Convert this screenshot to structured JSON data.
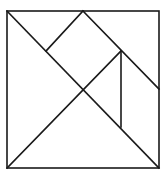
{
  "diagram": {
    "title": "",
    "type": "tangram-square",
    "stroke_color": "#1a1a1a",
    "background": "#ffffff",
    "outer_square": {
      "x": 7,
      "y": 11,
      "width": 152,
      "height": 157
    },
    "segments": [
      {
        "name": "diagonal-top-left-to-bottom-right",
        "x1": 7,
        "y1": 11,
        "x2": 159,
        "y2": 168
      },
      {
        "name": "diagonal-bottom-left-to-mid",
        "x1": 7,
        "y1": 168,
        "x2": 121,
        "y2": 51
      },
      {
        "name": "top-mid-to-right-edge",
        "x1": 83,
        "y1": 11,
        "x2": 159,
        "y2": 89
      },
      {
        "name": "top-mid-to-left-diag",
        "x1": 83,
        "y1": 11,
        "x2": 46,
        "y2": 51
      },
      {
        "name": "vertical-inner",
        "x1": 121,
        "y1": 51,
        "x2": 121,
        "y2": 127
      }
    ]
  }
}
